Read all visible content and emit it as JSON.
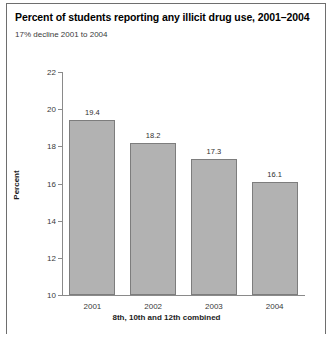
{
  "chart_data": {
    "type": "bar",
    "title": "Percent of students reporting any illicit drug use, 2001–2004",
    "subtitle": "17% decline 2001 to 2004",
    "categories": [
      "2001",
      "2002",
      "2003",
      "2004"
    ],
    "values": [
      19.4,
      18.2,
      17.3,
      16.1
    ],
    "value_labels": [
      "19.4",
      "18.2",
      "17.3",
      "16.1"
    ],
    "xlabel": "8th, 10th and 12th combined",
    "ylabel": "Percent",
    "ylim": [
      10,
      22
    ],
    "ytick_step": 2,
    "ytick_labels": [
      "22",
      "20",
      "18",
      "16",
      "14",
      "12",
      "10"
    ],
    "ytick_values": [
      22,
      20,
      18,
      16,
      14,
      12,
      10
    ],
    "grid": false,
    "legend": false,
    "bar_fill": "#b2b2b2",
    "bar_edge": "#7d7d7d",
    "axis_color": "#8a8a8a",
    "frame_color": "#6e6e6e"
  }
}
